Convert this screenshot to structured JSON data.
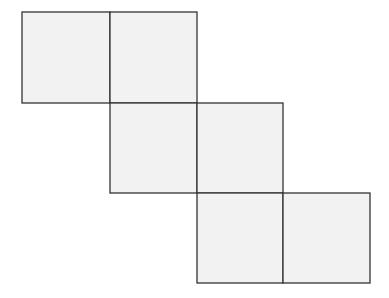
{
  "diagram": {
    "type": "cube-net",
    "fill_color": "#f2f2f2",
    "stroke_color": "#333333",
    "cells": [
      {
        "x": 22,
        "y": 12,
        "w": 88,
        "h": 91
      },
      {
        "x": 110,
        "y": 12,
        "w": 87,
        "h": 91
      },
      {
        "x": 110,
        "y": 103,
        "w": 87,
        "h": 90
      },
      {
        "x": 197,
        "y": 103,
        "w": 86,
        "h": 90
      },
      {
        "x": 197,
        "y": 193,
        "w": 86,
        "h": 90
      },
      {
        "x": 283,
        "y": 193,
        "w": 87,
        "h": 90
      }
    ]
  }
}
